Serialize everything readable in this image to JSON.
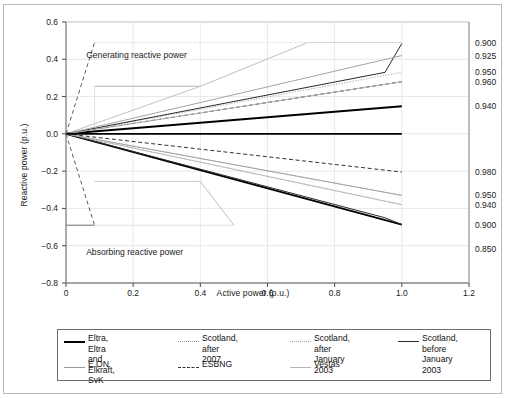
{
  "chart_data": {
    "type": "line",
    "title": "",
    "xlabel": "Active power (p.u.)",
    "ylabel": "Reactive power (p.u.)",
    "xlim": [
      0,
      1.2
    ],
    "ylim": [
      -0.8,
      0.6
    ],
    "xticks": [
      "0",
      "0.2",
      "0.4",
      "0.6",
      "0.8",
      "1.0",
      "1.2"
    ],
    "xtick_values": [
      0,
      0.2,
      0.4,
      0.6,
      0.8,
      1.0,
      1.2
    ],
    "yticks": [
      "0.6",
      "0.4",
      "0.2",
      "0.0",
      "-0.2",
      "-0.4",
      "-0.6",
      "-0.8"
    ],
    "ytick_values": [
      0.6,
      0.4,
      0.2,
      0.0,
      -0.2,
      -0.4,
      -0.6,
      -0.8
    ],
    "grid": true,
    "legend_position": "bottom",
    "annotations": [
      {
        "text": "Generating reactive power",
        "x": 0.06,
        "y": 0.42
      },
      {
        "text": "Absorbing reactive power",
        "x": 0.06,
        "y": -0.64
      }
    ],
    "right_axis_labels_generating": [
      "0.900",
      "0.925",
      "0.950",
      "0.960",
      "0.940"
    ],
    "right_axis_labels_absorbing": [
      "0.980",
      "0.950",
      "0.940",
      "0.900",
      "0.850"
    ],
    "power_factor_labels": [
      {
        "value": "0.900",
        "y": 0.485,
        "side": "generating"
      },
      {
        "value": "0.925",
        "y": 0.42,
        "side": "generating"
      },
      {
        "value": "0.950",
        "y": 0.33,
        "side": "generating"
      },
      {
        "value": "0.960",
        "y": 0.28,
        "side": "generating"
      },
      {
        "value": "0.940",
        "y": 0.148,
        "side": "generating"
      },
      {
        "value": "0.980",
        "y": -0.205,
        "side": "absorbing"
      },
      {
        "value": "0.950",
        "y": -0.33,
        "side": "absorbing"
      },
      {
        "value": "0.940",
        "y": -0.38,
        "side": "absorbing"
      },
      {
        "value": "0.900",
        "y": -0.487,
        "side": "absorbing"
      },
      {
        "value": "0.850",
        "y": -0.62,
        "side": "absorbing"
      }
    ],
    "series": [
      {
        "name": "Eltra, Eltra and Elkraft, SvK",
        "style": "solid",
        "weight": "bold",
        "color": "#000000",
        "points_upper": [
          [
            0,
            0
          ],
          [
            1.0,
            0.148
          ]
        ],
        "points_lower": [
          [
            0,
            0
          ],
          [
            1.0,
            -0.487
          ],
          [
            1.0,
            -0.487
          ]
        ]
      },
      {
        "name": "Scotland, after 2007",
        "style": "dotted",
        "weight": "light",
        "color": "#9a9a9a",
        "points_upper": [
          [
            0,
            0
          ],
          [
            1.0,
            0.33
          ]
        ],
        "points_lower": [
          [
            0,
            0
          ],
          [
            1.0,
            -0.33
          ]
        ]
      },
      {
        "name": "Scotland, after January 2003",
        "style": "dotted",
        "weight": "light",
        "color": "#a8a8a8",
        "points_upper": [
          [
            0,
            0
          ],
          [
            1.0,
            0.28
          ]
        ],
        "points_lower": [
          [
            0,
            0
          ],
          [
            1.0,
            -0.38
          ]
        ]
      },
      {
        "name": "Scotland, before January 2003",
        "style": "solid",
        "weight": "normal",
        "color": "#2a2a2a",
        "points_upper": [
          [
            0,
            0
          ],
          [
            0.95,
            0.33
          ],
          [
            1.0,
            0.485
          ]
        ],
        "points_lower": [
          [
            0,
            0
          ],
          [
            0.95,
            -0.45
          ],
          [
            1.0,
            -0.487
          ]
        ]
      },
      {
        "name": "E.ON",
        "style": "solid",
        "weight": "light",
        "color": "#9a9a9a",
        "points_upper": [
          [
            0,
            0
          ],
          [
            1.0,
            0.42
          ]
        ],
        "points_lower": [
          [
            0,
            0
          ],
          [
            1.0,
            -0.33
          ]
        ]
      },
      {
        "name": "ESBNG",
        "style": "dashed",
        "weight": "normal",
        "color": "#333333",
        "points_upper": [
          [
            0,
            0
          ],
          [
            1.0,
            0.28
          ]
        ],
        "points_lower": [
          [
            0,
            0
          ],
          [
            1.0,
            -0.205
          ]
        ]
      },
      {
        "name": "Vestas",
        "style": "solid",
        "weight": "light",
        "color": "#b5b5b5",
        "points_upper": [
          [
            0,
            0
          ],
          [
            1.0,
            0.28
          ]
        ],
        "points_lower": [
          [
            0,
            0
          ],
          [
            1.0,
            -0.38
          ]
        ]
      }
    ],
    "envelope_esbng": {
      "description": "ESBNG dashed envelope: steep rise to +0.49 and steep fall to -0.49 near low active power",
      "upper": [
        [
          0.0,
          0.0
        ],
        [
          0.085,
          0.49
        ]
      ],
      "upper_cap": [
        [
          0.085,
          0.49
        ],
        [
          1.0,
          0.49
        ]
      ],
      "lower": [
        [
          0.0,
          0.0
        ],
        [
          0.085,
          -0.49
        ]
      ],
      "lower_cap": [
        [
          0.0,
          -0.49
        ],
        [
          0.085,
          -0.49
        ]
      ]
    },
    "envelope_light": {
      "upper_plateau_y": 0.255,
      "upper_plateau_x_end": 0.4,
      "lower_plateau_y": -0.255,
      "lower_plateau_x_end": 0.4
    }
  },
  "axis": {
    "x_title": "Active power (p.u.)",
    "y_title": "Reactive power (p.u.)"
  },
  "legend": {
    "rows": [
      [
        {
          "label": "Eltra, Eltra and\nElkraft, SvK",
          "style": "solid-bold",
          "color": "#000000"
        },
        {
          "label": "Scotland,\nafter 2007",
          "style": "dotted-light",
          "color": "#9a9a9a"
        },
        {
          "label": "Scotland, after\nJanuary 2003",
          "style": "dotted-light",
          "color": "#a8a8a8"
        },
        {
          "label": "Scotland, before\nJanuary 2003",
          "style": "solid",
          "color": "#2a2a2a"
        }
      ],
      [
        {
          "label": "E.ON",
          "style": "solid-light",
          "color": "#9a9a9a"
        },
        {
          "label": "ESBNG",
          "style": "dashed",
          "color": "#333333"
        },
        {
          "label": "Vestas",
          "style": "solid-light",
          "color": "#b5b5b5"
        }
      ]
    ]
  },
  "bands": {
    "generating": "Generating reactive power",
    "absorbing": "Absorbing reactive power"
  }
}
